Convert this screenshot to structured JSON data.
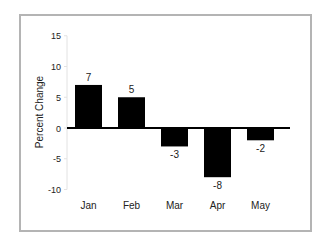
{
  "chart_data": {
    "type": "bar",
    "title": "",
    "xlabel": "",
    "ylabel": "Percent Change",
    "categories": [
      "Jan",
      "Feb",
      "Mar",
      "Apr",
      "May"
    ],
    "values": [
      7,
      5,
      -3,
      -8,
      -2
    ],
    "data_labels": [
      "7",
      "5",
      "-3",
      "-8",
      "-2"
    ],
    "ylim": [
      -10,
      15
    ],
    "yticks": [
      15,
      10,
      5,
      0,
      -5,
      -10
    ],
    "ytick_labels": [
      "15",
      "10",
      "5",
      "0",
      "-5",
      "-10"
    ],
    "grid": false,
    "legend": null,
    "bar_color": "#000000",
    "zero_line_color": "#000000",
    "frame_color": "#b4b4b4"
  }
}
